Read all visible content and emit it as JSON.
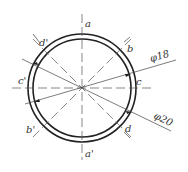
{
  "diagram": {
    "center": {
      "x": 82,
      "y": 88
    },
    "outer_radius": 54,
    "inner_radius": 49,
    "stroke_color": "#222222",
    "labels": {
      "a": "a",
      "a_prime": "a'",
      "b": "b",
      "b_prime": "b'",
      "c": "c",
      "c_prime": "c'",
      "d": "d",
      "d_prime": "d'",
      "dim_inner": "φ18",
      "dim_outer": "φ20"
    }
  }
}
